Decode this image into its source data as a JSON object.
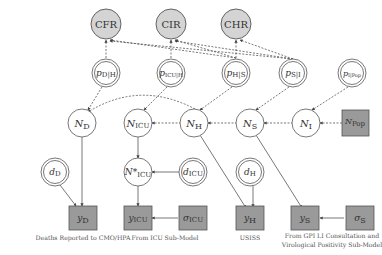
{
  "diagram": {
    "colors": {
      "shaded_circle_fill": "#d4d4d4",
      "observed_box_fill": "#9a9a9a",
      "stroke": "#555555",
      "background": "#ffffff"
    },
    "top_nodes": [
      {
        "id": "CFR",
        "label": "CFR"
      },
      {
        "id": "CIR",
        "label": "CIR"
      },
      {
        "id": "CHR",
        "label": "CHR"
      }
    ],
    "probability_nodes": [
      {
        "id": "pDH",
        "main": "p",
        "sub": "D|H"
      },
      {
        "id": "pICUH",
        "main": "p",
        "sub": "ICU|H"
      },
      {
        "id": "pHS",
        "main": "p",
        "sub": "H|S"
      },
      {
        "id": "pSI",
        "main": "p",
        "sub": "S|I"
      },
      {
        "id": "pIPop",
        "main": "p",
        "sub": "I|Pop"
      }
    ],
    "count_nodes": [
      {
        "id": "ND",
        "main": "N",
        "sub": "D"
      },
      {
        "id": "NICU",
        "main": "N",
        "sub": "ICU"
      },
      {
        "id": "NH",
        "main": "N",
        "sub": "H"
      },
      {
        "id": "NS",
        "main": "N",
        "sub": "S"
      },
      {
        "id": "NI",
        "main": "N",
        "sub": "I"
      },
      {
        "id": "NPop",
        "main": "N",
        "sub": "Pop"
      }
    ],
    "delay_nodes": [
      {
        "id": "dD",
        "main": "d",
        "sub": "D"
      },
      {
        "id": "NICUstar",
        "main": "N*",
        "sub": "ICU"
      },
      {
        "id": "dICU",
        "main": "d",
        "sub": "ICU"
      },
      {
        "id": "dH",
        "main": "d",
        "sub": "H"
      }
    ],
    "observed_nodes": [
      {
        "id": "yD",
        "main": "y",
        "sub": "D"
      },
      {
        "id": "yICU",
        "main": "y",
        "sub": "ICU"
      },
      {
        "id": "sigmaICU",
        "main": "σ",
        "sub": "ICU"
      },
      {
        "id": "yH",
        "main": "y",
        "sub": "H"
      },
      {
        "id": "yS",
        "main": "y",
        "sub": "S"
      },
      {
        "id": "sigmaS",
        "main": "σ",
        "sub": "S"
      }
    ],
    "captions": {
      "deaths": "Deaths Reported to CMO/HPA",
      "icu": "From ICU Sub-Model",
      "uss": "USISS",
      "gp_line1": "From GPI LI Consultation and",
      "gp_line2": "Virological Positivity Sub-Model"
    }
  }
}
